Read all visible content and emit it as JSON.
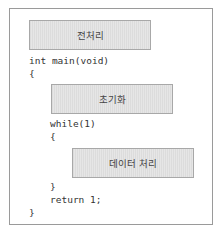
{
  "diagram": {
    "boxes": {
      "preprocess": "전처리",
      "init": "초기화",
      "data_processing": "데이터 처리"
    },
    "code": {
      "main_signature": "int main(void)",
      "open_brace_main": "{",
      "while_loop": "while(1)",
      "open_brace_while": "{",
      "close_brace_while": "}",
      "return_stmt": "return 1;",
      "close_brace_main": "}"
    }
  }
}
